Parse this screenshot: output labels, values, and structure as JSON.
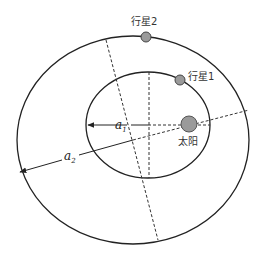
{
  "diagram": {
    "title": "",
    "labels": {
      "planet1": "行星1",
      "planet2": "行星2",
      "sun": "太阳",
      "a1_symbol": "a",
      "a1_subscript": "1",
      "a2_symbol": "a",
      "a2_subscript": "2"
    },
    "colors": {
      "stroke": "#222222",
      "body_fill": "#9a9a9a",
      "background": "#ffffff"
    },
    "orbits": [
      {
        "name": "inner-orbit",
        "planet": "行星1",
        "semi_major_axis": "a1"
      },
      {
        "name": "outer-orbit",
        "planet": "行星2",
        "semi_major_axis": "a2"
      }
    ]
  }
}
